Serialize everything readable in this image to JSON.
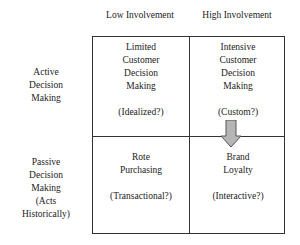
{
  "columns": [
    {
      "label": "Low Involvement"
    },
    {
      "label": "High Involvement"
    }
  ],
  "rows": [
    {
      "label_lines": [
        "Active",
        "Decision",
        "Making"
      ]
    },
    {
      "label_lines": [
        "Passive",
        "Decision",
        "Making",
        "(Acts",
        "Historically)"
      ]
    }
  ],
  "cells": {
    "active_low": {
      "lines": [
        "Limited",
        "Customer",
        "Decision",
        "Making"
      ],
      "tag": "(Idealized?)"
    },
    "active_high": {
      "lines": [
        "Intensive",
        "Customer",
        "Decision",
        "Making"
      ],
      "tag": "(Custom?)"
    },
    "passive_low": {
      "lines": [
        "Rote",
        "Purchasing"
      ],
      "tag": "(Transactional?)"
    },
    "passive_high": {
      "lines": [
        "Brand",
        "Loyalty"
      ],
      "tag": "(Interactive?)"
    }
  },
  "arrow": {
    "from": "active_high",
    "to": "passive_high",
    "icon": "down-arrow-icon",
    "fill": "#b5b5b5",
    "stroke": "#555555"
  }
}
